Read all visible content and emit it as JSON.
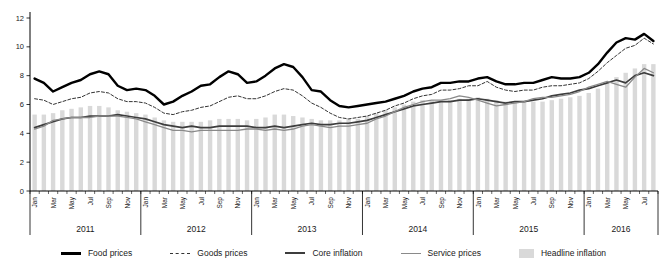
{
  "chart_data": {
    "type": "combo-bar-line",
    "title": "",
    "xlabel": "",
    "ylabel": "",
    "ylim": [
      0,
      12
    ],
    "yticks": [
      0,
      2,
      4,
      6,
      8,
      10,
      12
    ],
    "grid": false,
    "legend_position": "bottom",
    "month_names": [
      "Jan",
      "Feb",
      "Mar",
      "Apr",
      "May",
      "Jun",
      "Jul",
      "Aug",
      "Sep",
      "Oct",
      "Nov",
      "Dec"
    ],
    "years": [
      {
        "label": "2011",
        "months": 12
      },
      {
        "label": "2012",
        "months": 12
      },
      {
        "label": "2013",
        "months": 12
      },
      {
        "label": "2014",
        "months": 12
      },
      {
        "label": "2015",
        "months": 12
      },
      {
        "label": "2016",
        "months": 8
      }
    ],
    "bar_series": {
      "name": "Headline inflation",
      "color": "#d9d9d9",
      "values": [
        5.3,
        5.3,
        5.4,
        5.6,
        5.7,
        5.8,
        5.9,
        5.9,
        5.8,
        5.6,
        5.5,
        5.4,
        5.3,
        5.1,
        4.9,
        4.8,
        4.8,
        4.8,
        4.8,
        4.9,
        5.0,
        5.0,
        5.0,
        4.9,
        5.0,
        5.1,
        5.3,
        5.3,
        5.2,
        5.1,
        5.0,
        4.9,
        4.9,
        4.9,
        5.0,
        5.0,
        5.2,
        5.4,
        5.6,
        5.8,
        6.0,
        6.2,
        6.3,
        6.3,
        6.3,
        6.3,
        6.4,
        6.4,
        6.5,
        6.4,
        6.3,
        6.2,
        6.2,
        6.2,
        6.2,
        6.2,
        6.3,
        6.4,
        6.5,
        6.6,
        6.8,
        7.1,
        7.5,
        7.9,
        8.2,
        8.5,
        8.8,
        8.8
      ]
    },
    "line_series": [
      {
        "name": "Food prices",
        "style": "solid",
        "color": "#000000",
        "width": 2.4,
        "values": [
          7.8,
          7.5,
          6.9,
          7.2,
          7.5,
          7.7,
          8.1,
          8.3,
          8.1,
          7.3,
          7.0,
          7.1,
          7.0,
          6.6,
          6.0,
          6.2,
          6.6,
          6.9,
          7.3,
          7.4,
          7.9,
          8.3,
          8.1,
          7.5,
          7.6,
          8.0,
          8.5,
          8.8,
          8.6,
          7.9,
          7.0,
          6.9,
          6.3,
          5.9,
          5.8,
          5.9,
          6.0,
          6.1,
          6.2,
          6.4,
          6.6,
          6.9,
          7.1,
          7.2,
          7.5,
          7.5,
          7.6,
          7.6,
          7.8,
          7.9,
          7.6,
          7.4,
          7.4,
          7.5,
          7.5,
          7.7,
          7.9,
          7.8,
          7.8,
          7.9,
          8.2,
          8.8,
          9.6,
          10.3,
          10.6,
          10.5,
          10.9,
          10.4
        ]
      },
      {
        "name": "Goods prices",
        "style": "dashed",
        "color": "#333333",
        "width": 1.0,
        "values": [
          6.4,
          6.3,
          6.0,
          6.2,
          6.4,
          6.5,
          6.8,
          6.9,
          6.8,
          6.4,
          6.2,
          6.2,
          6.1,
          5.8,
          5.4,
          5.3,
          5.5,
          5.6,
          5.8,
          5.9,
          6.2,
          6.5,
          6.6,
          6.4,
          6.4,
          6.6,
          6.9,
          7.1,
          7.0,
          6.6,
          6.1,
          5.8,
          5.4,
          5.1,
          5.0,
          5.1,
          5.2,
          5.4,
          5.6,
          5.9,
          6.1,
          6.4,
          6.6,
          6.7,
          7.0,
          7.0,
          7.1,
          7.3,
          7.3,
          7.6,
          7.2,
          7.0,
          6.9,
          7.0,
          7.0,
          7.2,
          7.3,
          7.3,
          7.4,
          7.5,
          7.8,
          8.3,
          8.9,
          9.4,
          9.9,
          10.1,
          10.6,
          10.2
        ]
      },
      {
        "name": "Core inflation",
        "style": "solid",
        "color": "#3d3d3d",
        "width": 1.7,
        "values": [
          4.4,
          4.6,
          4.8,
          5.0,
          5.1,
          5.1,
          5.2,
          5.2,
          5.2,
          5.3,
          5.2,
          5.1,
          5.0,
          4.8,
          4.6,
          4.5,
          4.4,
          4.5,
          4.4,
          4.4,
          4.5,
          4.5,
          4.5,
          4.5,
          4.4,
          4.4,
          4.5,
          4.4,
          4.5,
          4.6,
          4.7,
          4.6,
          4.6,
          4.7,
          4.7,
          4.8,
          4.9,
          5.1,
          5.3,
          5.5,
          5.7,
          5.9,
          6.0,
          6.1,
          6.2,
          6.2,
          6.3,
          6.3,
          6.4,
          6.3,
          6.2,
          6.1,
          6.2,
          6.2,
          6.3,
          6.4,
          6.6,
          6.7,
          6.8,
          7.0,
          7.1,
          7.3,
          7.5,
          7.7,
          7.5,
          8.0,
          8.2,
          8.0
        ]
      },
      {
        "name": "Service prices",
        "style": "solid",
        "color": "#8a8a8a",
        "width": 1.3,
        "values": [
          4.3,
          4.5,
          4.9,
          5.0,
          5.1,
          5.1,
          5.1,
          5.2,
          5.2,
          5.2,
          5.1,
          5.0,
          4.8,
          4.6,
          4.4,
          4.2,
          4.2,
          4.1,
          4.2,
          4.2,
          4.2,
          4.2,
          4.2,
          4.3,
          4.3,
          4.2,
          4.3,
          4.2,
          4.3,
          4.5,
          4.6,
          4.5,
          4.4,
          4.5,
          4.5,
          4.6,
          4.7,
          5.0,
          5.2,
          5.5,
          5.8,
          6.0,
          6.2,
          6.3,
          6.3,
          6.4,
          6.6,
          6.5,
          6.3,
          6.1,
          5.9,
          6.0,
          6.1,
          6.2,
          6.4,
          6.5,
          6.5,
          6.6,
          6.7,
          6.9,
          7.2,
          7.4,
          7.6,
          7.4,
          7.2,
          7.9,
          8.5,
          8.2
        ]
      }
    ],
    "axis_color": "#000000",
    "tick_label_color": "#1a1a1a"
  }
}
